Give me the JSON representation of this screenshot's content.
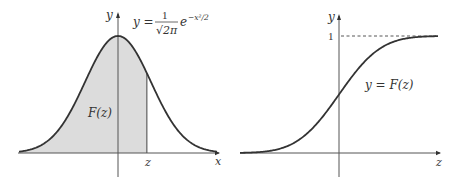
{
  "chart_data": [
    {
      "type": "area",
      "title": "Standard normal density with shaded area F(z)",
      "formula": {
        "lhs": "y =",
        "numerator": "1",
        "denominator": "√2π",
        "exponential": "e",
        "exponent": "−x²/2"
      },
      "xlabel": "x",
      "ylabel": "y",
      "annotations": {
        "area_label": "F(z)",
        "z_tick_label": "z"
      },
      "function": "y = (1/√(2π)) e^(−x²/2)",
      "x_range": [
        -3.0,
        3.0
      ],
      "shaded_region": {
        "from": -3.0,
        "to": "z",
        "z_value_approx": 0.7
      },
      "points": {
        "x": [
          -3.0,
          -2.5,
          -2.0,
          -1.5,
          -1.0,
          -0.5,
          0.0,
          0.5,
          1.0,
          1.5,
          2.0,
          2.5,
          3.0
        ],
        "y": [
          0.004,
          0.018,
          0.054,
          0.13,
          0.242,
          0.352,
          0.399,
          0.352,
          0.242,
          0.13,
          0.054,
          0.018,
          0.004
        ]
      },
      "grid": false,
      "legend": null
    },
    {
      "type": "line",
      "title": "Standard normal cumulative distribution function",
      "xlabel": "z",
      "ylabel": "y",
      "annotations": {
        "curve_label": "y = F(z)",
        "asymptote_label": "1"
      },
      "function": "y = F(z)",
      "x_range": [
        -3.0,
        3.0
      ],
      "ylim": [
        0,
        1
      ],
      "asymptote": {
        "y": 1,
        "style": "dashed"
      },
      "points": {
        "x": [
          -3.0,
          -2.5,
          -2.0,
          -1.5,
          -1.0,
          -0.5,
          0.0,
          0.5,
          1.0,
          1.5,
          2.0,
          2.5,
          3.0
        ],
        "y": [
          0.001,
          0.006,
          0.023,
          0.067,
          0.159,
          0.309,
          0.5,
          0.691,
          0.841,
          0.933,
          0.977,
          0.994,
          0.999
        ]
      },
      "grid": false,
      "legend": null
    }
  ],
  "left_plot": {
    "y_axis_label": "y",
    "x_axis_label": "x",
    "formula_lhs": "y =",
    "formula_num": "1",
    "formula_den": "√2π",
    "formula_e": "e",
    "formula_exp": "−x²/2",
    "area_label": "F(z)",
    "z_label": "z"
  },
  "right_plot": {
    "y_axis_label": "y",
    "x_axis_label": "z",
    "one_label": "1",
    "curve_label": "y = F(z)"
  }
}
